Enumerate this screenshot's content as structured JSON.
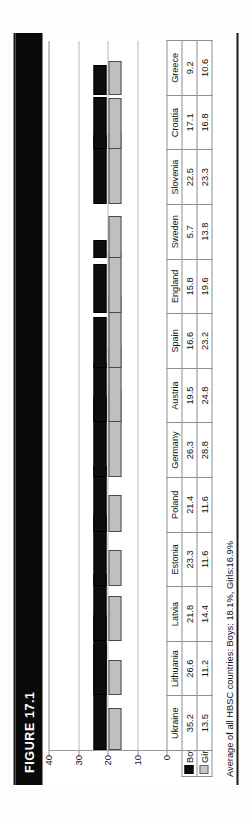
{
  "figure": {
    "label": "FIGURE 17.1",
    "footnote": "Average of all HBSC countries: Boys: 18.1%, Girls:16.9%"
  },
  "legend": {
    "boys_label": "Boys",
    "girls_label": "Girls",
    "boys_color": "#0d0d0d",
    "girls_color": "#bfbfbf"
  },
  "chart_data": {
    "type": "bar",
    "title": "FIGURE 17.1",
    "xlabel": "",
    "ylabel": "",
    "ylim": [
      0,
      40
    ],
    "yticks": [
      0,
      10,
      20,
      30,
      40
    ],
    "grid": true,
    "legend_position": "table-row-header",
    "categories": [
      "Ukraine",
      "Lithuania",
      "Latvia",
      "Estonia",
      "Poland",
      "Germany",
      "Austria",
      "Spain",
      "England",
      "Sweden",
      "Slovenia",
      "Croatia",
      "Greece"
    ],
    "series": [
      {
        "name": "Boys",
        "values": [
          35.2,
          26.6,
          21.8,
          23.3,
          21.4,
          26.3,
          19.5,
          16.6,
          15.8,
          5.7,
          22.5,
          17.1,
          9.2
        ]
      },
      {
        "name": "Girls",
        "values": [
          13.5,
          11.2,
          14.4,
          11.6,
          11.6,
          28.8,
          24.8,
          23.2,
          19.6,
          13.8,
          23.3,
          16.8,
          10.6
        ]
      }
    ],
    "annotations": [
      "Average of all HBSC countries: Boys: 18.1%, Girls:16.9%"
    ]
  }
}
